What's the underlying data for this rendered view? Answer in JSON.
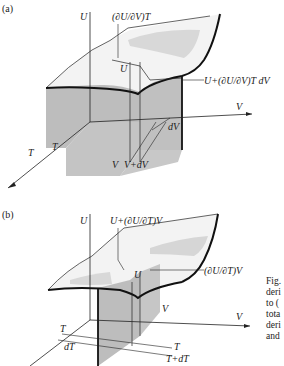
{
  "figure": {
    "panel_a": {
      "label": "(a)",
      "axis_U": "U",
      "axis_V": "V",
      "axis_T": "T",
      "slope_label": "(∂U/∂V)T",
      "point_U": "U",
      "increment_label": "U+(∂U/∂V)T dV",
      "dV": "dV",
      "V_tick": "V",
      "V_plus_dV": "V+dV",
      "T_tick": "T"
    },
    "panel_b": {
      "label": "(b)",
      "axis_U": "U",
      "axis_V": "V",
      "increment_label": "U+(∂U/∂T)V",
      "point_U": "U",
      "slope_label": "(∂U/∂T)V",
      "V_tick": "V",
      "T_tick": "T",
      "T_tick_right": "T",
      "T_plus_dT": "T+dT",
      "dT": "dT"
    },
    "caption_fragments": [
      "Fig.",
      "deri",
      "to (",
      "tota",
      "deri",
      "and"
    ]
  },
  "colors": {
    "shade": "#b9b9b9",
    "surface_shade": "#d6d6d6",
    "line": "#222222"
  }
}
